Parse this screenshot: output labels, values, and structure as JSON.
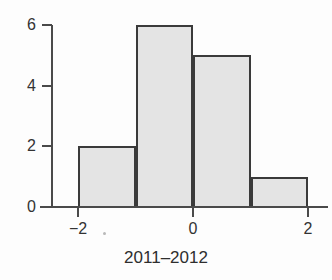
{
  "chart_data": {
    "type": "bar",
    "title": "",
    "subtitle": "",
    "xlabel": "2011–2012",
    "ylabel": "",
    "categories": [
      "[-2,-1)",
      "[-1,0)",
      "[0,1)",
      "[1,2]"
    ],
    "bin_edges": [
      -2,
      -1,
      0,
      1,
      2
    ],
    "values": [
      2,
      6,
      5,
      1
    ],
    "xlim": [
      -2.65,
      2.35
    ],
    "ylim": [
      0,
      6.0
    ],
    "x_ticks": [
      -2,
      0,
      2
    ],
    "x_tick_labels": [
      "−2",
      "0",
      "2"
    ],
    "y_ticks": [
      0,
      2,
      4,
      6
    ],
    "y_tick_labels": [
      "0",
      "2",
      "4",
      "6"
    ],
    "grid": false,
    "legend": false,
    "legend_position": "none",
    "bar_fill_color": "#e4e4e4",
    "bar_edge_color": "#3a3a3a",
    "axis_color": "#4a4a4a",
    "background_color": "#fdfdfd"
  },
  "axes": {
    "x_title": "2011–2012",
    "y_ticks": [
      {
        "label": "6",
        "value": 6
      },
      {
        "label": "4",
        "value": 4
      },
      {
        "label": "2",
        "value": 2
      },
      {
        "label": "0",
        "value": 0
      }
    ],
    "x_ticks": [
      {
        "label": "−2",
        "value": -2
      },
      {
        "label": "0",
        "value": 0
      },
      {
        "label": "2",
        "value": 2
      }
    ]
  },
  "bars": [
    {
      "label": "[-2,-1)",
      "value": 2,
      "x0": -2,
      "x1": -1
    },
    {
      "label": "[-1,0)",
      "value": 6,
      "x0": -1,
      "x1": 0
    },
    {
      "label": "[0,1)",
      "value": 5,
      "x0": 0,
      "x1": 1
    },
    {
      "label": "[1,2]",
      "value": 1,
      "x0": 1,
      "x1": 2
    }
  ]
}
